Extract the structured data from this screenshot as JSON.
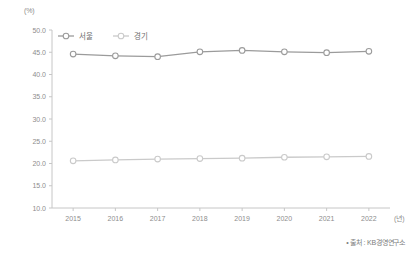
{
  "chart_data": {
    "type": "line",
    "title": "",
    "subtitle": "",
    "xlabel": "(년)",
    "ylabel": "(%)",
    "unit_label": "(%)",
    "x_unit_label": "(년)",
    "categories": [
      "2015",
      "2016",
      "2017",
      "2018",
      "2019",
      "2020",
      "2021",
      "2022"
    ],
    "x": [
      2015,
      2016,
      2017,
      2018,
      2019,
      2020,
      2021,
      2022
    ],
    "series": [
      {
        "name": "서울",
        "color": "#9b9b9b",
        "marker": "circle-open",
        "values": [
          44.6,
          44.2,
          44.0,
          45.1,
          45.4,
          45.1,
          44.9,
          45.2
        ]
      },
      {
        "name": "경기",
        "color": "#cacaca",
        "marker": "circle-open",
        "values": [
          20.6,
          20.8,
          21.0,
          21.1,
          21.2,
          21.4,
          21.5,
          21.6
        ]
      }
    ],
    "ylim": [
      10.0,
      50.0
    ],
    "ytick_values": [
      10.0,
      15.0,
      20.0,
      25.0,
      30.0,
      35.0,
      40.0,
      45.0,
      50.0
    ],
    "ytick_labels": [
      "10.0",
      "15.0",
      "20.0",
      "25.0",
      "30.0",
      "35.0",
      "40.0",
      "45.0",
      "50.0"
    ],
    "grid": false,
    "legend_position": "top-left",
    "legend": [
      "서울",
      "경기"
    ]
  },
  "source": {
    "text": "• 출처 : KB경영연구소"
  },
  "colors": {
    "axis": "#c6c6c6",
    "tick_text": "#8d8d8d",
    "series_seoul": "#9b9b9b",
    "series_gyeonggi": "#cacaca",
    "background": "#ffffff"
  }
}
